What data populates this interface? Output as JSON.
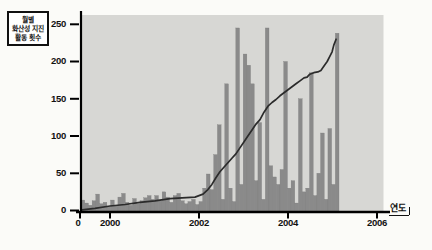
{
  "chart_data": {
    "type": "bar+line",
    "title_lines": [
      "월별",
      "화산성 지진",
      "활동 횟수"
    ],
    "x_axis_label": "연도",
    "x_tick_labels": [
      "0",
      "2000",
      "2002",
      "2004",
      "2006"
    ],
    "x_tick_years": [
      2000,
      2002,
      2004,
      2006
    ],
    "y_tick_labels": [
      "250",
      "200",
      "150",
      "100",
      "50",
      "0"
    ],
    "y_ticks": [
      250,
      200,
      150,
      100,
      50,
      0
    ],
    "ylim": [
      0,
      265
    ],
    "grid": false,
    "legend": false,
    "bars": {
      "x_start_year": 1999.35,
      "step_years": 0.0828,
      "values": [
        14,
        10,
        7,
        13,
        22,
        9,
        11,
        5,
        14,
        7,
        18,
        23,
        11,
        7,
        16,
        9,
        13,
        17,
        20,
        15,
        20,
        13,
        25,
        18,
        11,
        20,
        23,
        13,
        9,
        12,
        15,
        8,
        12,
        30,
        49,
        28,
        75,
        115,
        15,
        170,
        30,
        12,
        245,
        35,
        210,
        195,
        170,
        40,
        118,
        15,
        245,
        60,
        45,
        35,
        55,
        200,
        30,
        40,
        10,
        150,
        25,
        30,
        185,
        20,
        50,
        104,
        15,
        110,
        35,
        238
      ]
    },
    "line_points": [
      [
        1999.37,
        1
      ],
      [
        1999.66,
        3
      ],
      [
        2000.0,
        6
      ],
      [
        2000.34,
        8
      ],
      [
        2000.67,
        11
      ],
      [
        2001.01,
        13
      ],
      [
        2001.35,
        16
      ],
      [
        2001.62,
        17
      ],
      [
        2001.91,
        18
      ],
      [
        2002.09,
        22
      ],
      [
        2002.2,
        28
      ],
      [
        2002.29,
        35
      ],
      [
        2002.38,
        44
      ],
      [
        2002.47,
        52
      ],
      [
        2002.56,
        58
      ],
      [
        2002.65,
        64
      ],
      [
        2002.74,
        70
      ],
      [
        2002.83,
        76
      ],
      [
        2002.92,
        84
      ],
      [
        2003.01,
        92
      ],
      [
        2003.1,
        100
      ],
      [
        2003.19,
        108
      ],
      [
        2003.28,
        116
      ],
      [
        2003.37,
        122
      ],
      [
        2003.46,
        132
      ],
      [
        2003.55,
        140
      ],
      [
        2003.64,
        145
      ],
      [
        2003.73,
        149
      ],
      [
        2003.82,
        154
      ],
      [
        2003.91,
        158
      ],
      [
        2004.0,
        162
      ],
      [
        2004.09,
        166
      ],
      [
        2004.18,
        170
      ],
      [
        2004.27,
        174
      ],
      [
        2004.36,
        178
      ],
      [
        2004.43,
        179
      ],
      [
        2004.49,
        183
      ],
      [
        2004.58,
        185
      ],
      [
        2004.67,
        186
      ],
      [
        2004.74,
        188
      ],
      [
        2004.81,
        194
      ],
      [
        2004.88,
        200
      ],
      [
        2004.94,
        207
      ],
      [
        2004.99,
        213
      ],
      [
        2005.03,
        222
      ],
      [
        2005.08,
        230
      ]
    ],
    "colors": {
      "plot_bg": "#d7d7d4",
      "bar": "#8a8a8a",
      "bar_edge": "#7b7b7b",
      "line": "#2b2b2b",
      "axis": "#000000",
      "text": "#111111",
      "page_bg": "#fbfbf8"
    }
  }
}
